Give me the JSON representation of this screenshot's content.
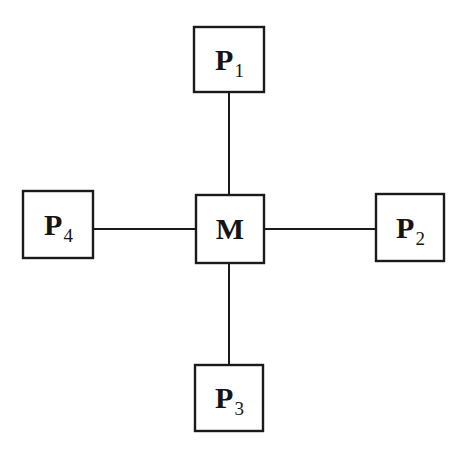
{
  "diagram": {
    "type": "star-topology",
    "background_color": "#ffffff",
    "stroke_color": "#1a1a1a",
    "text_color": "#151515",
    "nodes": [
      {
        "id": "p1",
        "label_base": "P",
        "label_sub": "1",
        "role": "peripheral",
        "position": "top",
        "box": {
          "x": 194,
          "y": 27,
          "w": 70,
          "h": 65
        }
      },
      {
        "id": "m",
        "label_base": "M",
        "label_sub": "",
        "role": "center",
        "position": "center",
        "box": {
          "x": 196,
          "y": 195,
          "w": 68,
          "h": 68
        }
      },
      {
        "id": "p2",
        "label_base": "P",
        "label_sub": "2",
        "role": "peripheral",
        "position": "right",
        "box": {
          "x": 376,
          "y": 194,
          "w": 68,
          "h": 67
        }
      },
      {
        "id": "p3",
        "label_base": "P",
        "label_sub": "3",
        "role": "peripheral",
        "position": "bottom",
        "box": {
          "x": 195,
          "y": 365,
          "w": 68,
          "h": 66
        }
      },
      {
        "id": "p4",
        "label_base": "P",
        "label_sub": "4",
        "role": "peripheral",
        "position": "left",
        "box": {
          "x": 23,
          "y": 191,
          "w": 70,
          "h": 67
        }
      }
    ],
    "edges": [
      {
        "id": "edge-m-p1",
        "from": "m",
        "to": "p1",
        "x1": 229,
        "y1": 195,
        "x2": 229,
        "y2": 92
      },
      {
        "id": "edge-m-p2",
        "from": "m",
        "to": "p2",
        "x1": 264,
        "y1": 229,
        "x2": 376,
        "y2": 229
      },
      {
        "id": "edge-m-p3",
        "from": "m",
        "to": "p3",
        "x1": 229,
        "y1": 263,
        "x2": 229,
        "y2": 365
      },
      {
        "id": "edge-m-p4",
        "from": "m",
        "to": "p4",
        "x1": 93,
        "y1": 229,
        "x2": 196,
        "y2": 229
      }
    ]
  }
}
